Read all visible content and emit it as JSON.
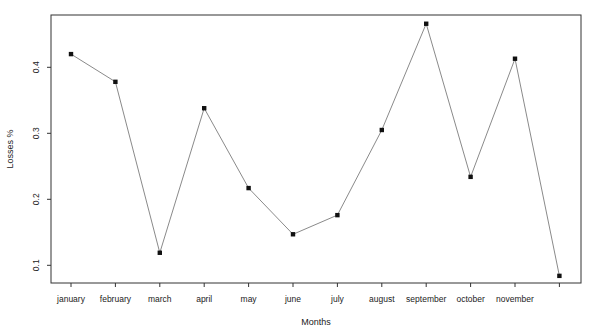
{
  "chart_data": {
    "type": "line",
    "title": "",
    "xlabel": "Months",
    "ylabel": "Losses %",
    "categories": [
      "january",
      "february",
      "march",
      "april",
      "may",
      "june",
      "july",
      "august",
      "september",
      "october",
      "november",
      "december"
    ],
    "x_tick_labels": [
      "january",
      "february",
      "march",
      "april",
      "may",
      "june",
      "july",
      "august",
      "september",
      "october",
      "november",
      ""
    ],
    "values": [
      0.42,
      0.378,
      0.119,
      0.338,
      0.217,
      0.147,
      0.176,
      0.305,
      0.466,
      0.234,
      0.413,
      0.084
    ],
    "y_ticks": [
      0.1,
      0.2,
      0.3,
      0.4
    ],
    "y_tick_labels": [
      "0.1",
      "0.2",
      "0.3",
      "0.4"
    ],
    "ylim": [
      0.07,
      0.48
    ],
    "grid": false,
    "legend": null,
    "colors": {
      "line": "#8a8a8a",
      "marker": "#111111",
      "axis": "#333333"
    }
  }
}
